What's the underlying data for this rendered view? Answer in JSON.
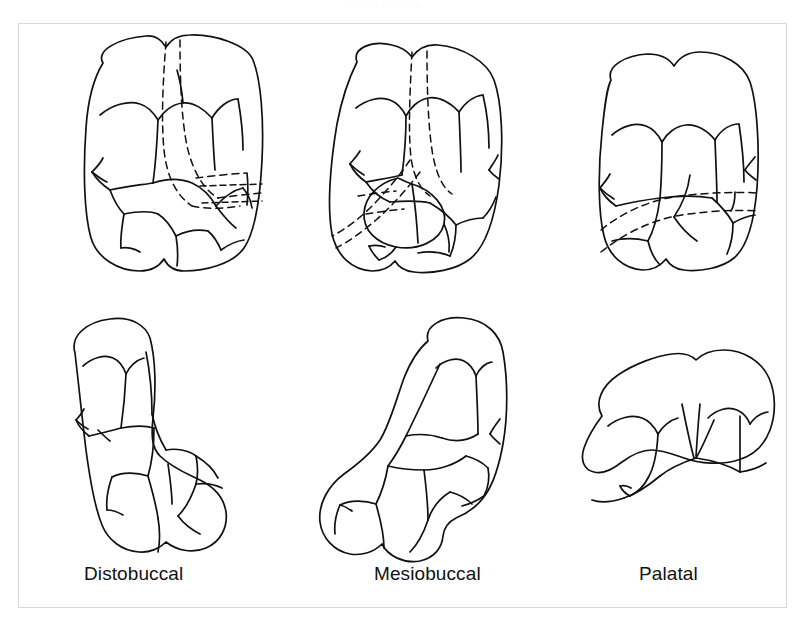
{
  "figure": {
    "top_caption": "Maxillary First Molar",
    "frame": {
      "border_color": "#d8d8d8",
      "background_color": "#ffffff"
    },
    "ink_color": "#111111",
    "background_color": "#ffffff"
  },
  "columns": [
    {
      "id": "distobuccal",
      "label": "Distobuccal"
    },
    {
      "id": "mesiobuccal",
      "label": "Mesiobuccal"
    },
    {
      "id": "palatal",
      "label": "Palatal"
    }
  ],
  "rows": [
    {
      "id": "occlusal-view",
      "label": ""
    },
    {
      "id": "root-view",
      "label": ""
    }
  ],
  "drawings": [
    {
      "id": "occlusal-distobuccal",
      "column": "Distobuccal",
      "row": "occlusal"
    },
    {
      "id": "occlusal-mesiobuccal",
      "column": "Mesiobuccal",
      "row": "occlusal"
    },
    {
      "id": "occlusal-palatal",
      "column": "Palatal",
      "row": "occlusal"
    },
    {
      "id": "profile-distobuccal",
      "column": "Distobuccal",
      "row": "profile"
    },
    {
      "id": "profile-mesiobuccal",
      "column": "Mesiobuccal",
      "row": "profile"
    },
    {
      "id": "profile-palatal",
      "column": "Palatal",
      "row": "profile"
    }
  ]
}
